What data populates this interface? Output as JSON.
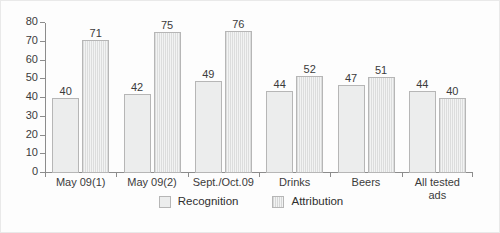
{
  "chart_data": {
    "type": "bar",
    "title": "",
    "subtitle": "",
    "xlabel": "",
    "ylabel": "",
    "ylim": [
      0,
      80
    ],
    "yticks": [
      0,
      10,
      20,
      30,
      40,
      50,
      60,
      70,
      80
    ],
    "grid": false,
    "legend_position": "bottom-center",
    "categories": [
      "May 09(1)",
      "May 09(2)",
      "Sept./Oct.09",
      "Drinks",
      "Beers",
      "All tested\nads"
    ],
    "series": [
      {
        "name": "Recognition",
        "values": [
          40,
          42,
          49,
          44,
          47,
          44
        ],
        "color": "#eceded",
        "pattern": "solid"
      },
      {
        "name": "Attribution",
        "values": [
          71,
          75,
          76,
          52,
          51,
          40
        ],
        "color": "#dcdddd",
        "pattern": "vertical-stripes"
      }
    ]
  },
  "legend": {
    "items": [
      {
        "label": "Recognition"
      },
      {
        "label": "Attribution"
      }
    ]
  },
  "axes": {
    "y_tick_labels": [
      "0",
      "10",
      "20",
      "30",
      "40",
      "50",
      "60",
      "70",
      "80"
    ],
    "x_tick_labels": [
      "May 09(1)",
      "May 09(2)",
      "Sept./Oct.09",
      "Drinks",
      "Beers",
      "All tested\nads"
    ]
  },
  "colors": {
    "axis": "#8c8c8c",
    "text": "#3b3b3b",
    "recognition": "#eceded",
    "attribution": "#dcdddd",
    "bar_border": "#b6b6b6",
    "frame": "#e9e9e9",
    "background": "#fdfdfd"
  }
}
